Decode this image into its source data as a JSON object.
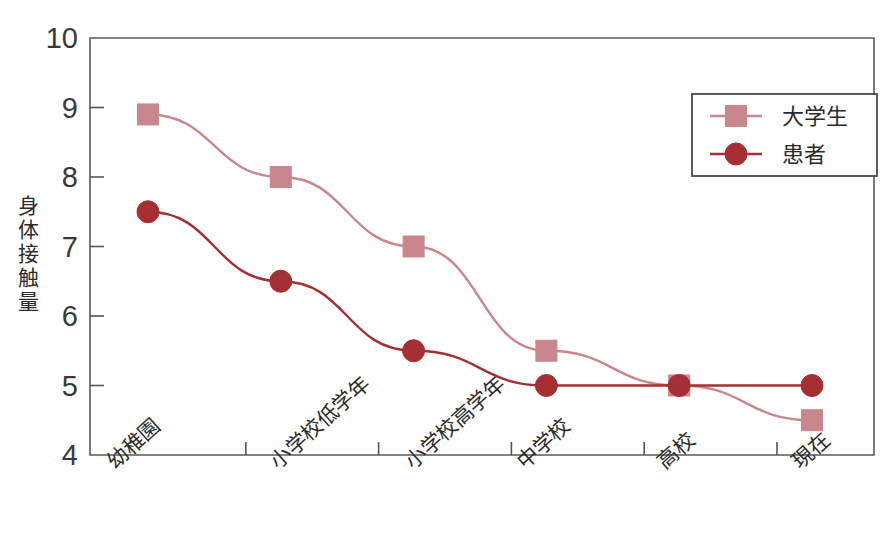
{
  "chart_data": {
    "type": "line",
    "title": "",
    "xlabel": "",
    "ylabel": "身体接触量",
    "categories": [
      "幼稚園",
      "小学校低学年",
      "小学校高学年",
      "中学校",
      "高校",
      "現在"
    ],
    "ylim": [
      4,
      10
    ],
    "yticks": [
      4,
      5,
      6,
      7,
      8,
      9,
      10
    ],
    "ytick_labels": [
      "4",
      "5",
      "6",
      "7",
      "8",
      "9",
      "10"
    ],
    "grid": false,
    "legend_position": "top-right",
    "series": [
      {
        "name": "大学生",
        "color": "#c9868c",
        "marker": "square",
        "values": [
          8.9,
          8.0,
          7.0,
          5.5,
          5.0,
          4.5
        ]
      },
      {
        "name": "患者",
        "color": "#a62f33",
        "marker": "circle",
        "values": [
          7.5,
          6.5,
          5.5,
          5.0,
          5.0,
          5.0
        ]
      }
    ]
  },
  "axis": {
    "frame_color": "#555555",
    "tick_color": "#555555"
  },
  "legend": {
    "border_color": "#4a4a4a",
    "entries": [
      {
        "label": "大学生",
        "marker": "square-marker",
        "color": "#c9868c"
      },
      {
        "label": "患者",
        "marker": "circle-marker",
        "color": "#a62f33"
      }
    ]
  },
  "caption": {
    "text": ""
  }
}
